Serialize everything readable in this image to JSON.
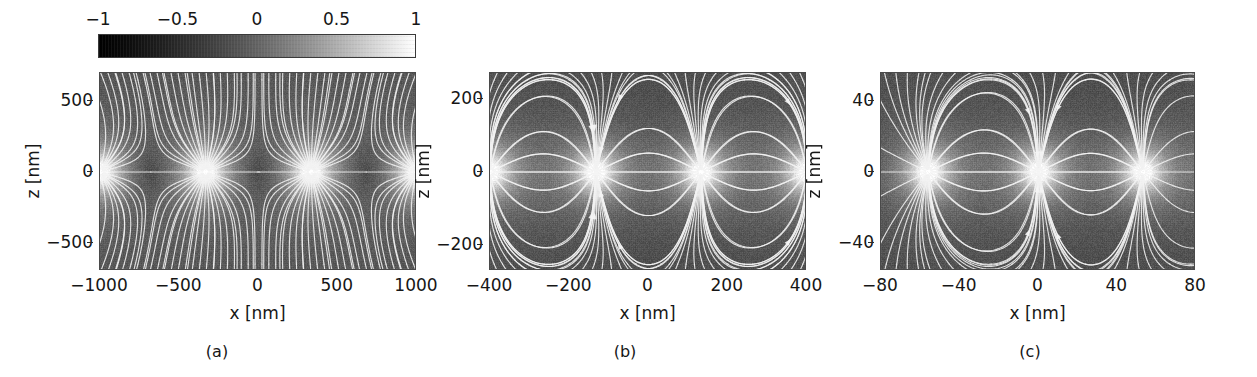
{
  "figure": {
    "background_color": "#ffffff",
    "text_color": "#161616"
  },
  "colorbar": {
    "name": "normalized-field-colorbar",
    "orientation": "horizontal",
    "vmin": -1,
    "vmax": 1,
    "colormap": "gray",
    "low_color": "#000000",
    "high_color": "#ffffff",
    "ticks": [
      {
        "label": "−1",
        "value": -1,
        "pos_pct": 0
      },
      {
        "label": "−0.5",
        "value": -0.5,
        "pos_pct": 25
      },
      {
        "label": "0",
        "value": 0,
        "pos_pct": 50
      },
      {
        "label": "0.5",
        "value": 0.5,
        "pos_pct": 75
      },
      {
        "label": "1",
        "value": 1,
        "pos_pct": 100
      }
    ]
  },
  "chart_data": [
    {
      "id": "panel-a",
      "type": "heatmap",
      "caption": "(a)",
      "title": "",
      "xlabel": "x [nm]",
      "ylabel": "z [nm]",
      "xlim": [
        -1000,
        1000
      ],
      "ylim": [
        -700,
        700
      ],
      "xticks": [
        -1000,
        -500,
        0,
        500,
        1000
      ],
      "xticklabels": [
        "−1000",
        "−500",
        "0",
        "500",
        "1000"
      ],
      "yticks": [
        500,
        0,
        -500
      ],
      "yticklabels": [
        "500",
        "0",
        "−500"
      ],
      "grid": false,
      "colorbar_ref": "normalized-field-colorbar",
      "overlay": "streamlines",
      "field": {
        "description": "periodic magnetic stray field above and below a domain pattern",
        "period_nm": 666,
        "pole_spacing_nm": 666,
        "poles_x_nm": [
          -1000,
          -333,
          333,
          1000
        ],
        "pole_polarity": [
          "+",
          "+",
          "+",
          "+"
        ],
        "source_plane_z_nm": 0,
        "bright_lobes": 3,
        "streamline_count": 46
      }
    },
    {
      "id": "panel-b",
      "type": "heatmap",
      "caption": "(b)",
      "title": "",
      "xlabel": "x [nm]",
      "ylabel": "z [nm]",
      "xlim": [
        -400,
        400
      ],
      "ylim": [
        -270,
        270
      ],
      "xticks": [
        -400,
        -200,
        0,
        200,
        400
      ],
      "xticklabels": [
        "−400",
        "−200",
        "0",
        "200",
        "400"
      ],
      "yticks": [
        200,
        0,
        -200
      ],
      "yticklabels": [
        "200",
        "0",
        "−200"
      ],
      "grid": false,
      "colorbar_ref": "normalized-field-colorbar",
      "overlay": "streamlines",
      "field": {
        "description": "dipolar stray field with alternating poles in the z = 0 plane",
        "period_nm": 533,
        "pole_spacing_nm": 266,
        "poles_x_nm": [
          -400,
          -133,
          133,
          400
        ],
        "pole_polarity": [
          "+",
          "−",
          "+",
          "−"
        ],
        "source_plane_z_nm": 0,
        "bright_lobes": 3,
        "streamline_count": 38
      }
    },
    {
      "id": "panel-c",
      "type": "heatmap",
      "caption": "(c)",
      "title": "",
      "xlabel": "x [nm]",
      "ylabel": "z [nm]",
      "xlim": [
        -80,
        80
      ],
      "ylim": [
        -56,
        56
      ],
      "xticks": [
        -80,
        -40,
        0,
        40,
        80
      ],
      "xticklabels": [
        "−80",
        "−40",
        "0",
        "40",
        "80"
      ],
      "yticks": [
        40,
        0,
        -40
      ],
      "yticklabels": [
        "40",
        "0",
        "−40"
      ],
      "grid": false,
      "colorbar_ref": "normalized-field-colorbar",
      "overlay": "streamlines",
      "field": {
        "description": "single bright pole at the left with dipolar loops repeating to the right",
        "period_nm": 107,
        "pole_spacing_nm": 53,
        "poles_x_nm": [
          -56,
          0,
          53,
          107
        ],
        "pole_polarity": [
          "+",
          "−",
          "+",
          "−"
        ],
        "source_plane_z_nm": 0,
        "bright_lobes": 1,
        "streamline_count": 30
      }
    }
  ]
}
